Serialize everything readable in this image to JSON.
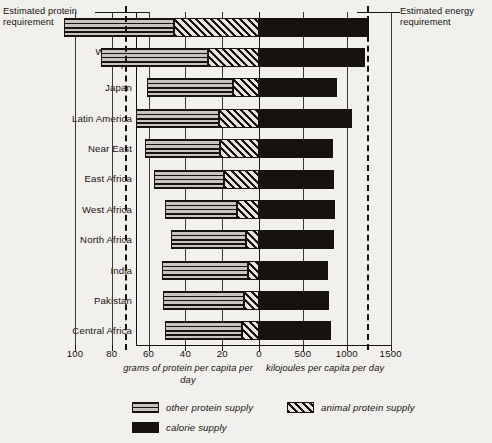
{
  "annotations": {
    "protein_requirement": "Estimated protein\nrequirement",
    "energy_requirement": "Estimated energy\nrequirement"
  },
  "axes": {
    "protein": {
      "title": "grams of protein per capita\nper day",
      "ticks": [
        100,
        80,
        60,
        40,
        20,
        0
      ],
      "tick_labels": [
        "100",
        "80",
        "60",
        "40",
        "20",
        "0"
      ]
    },
    "energy": {
      "title": "kilojoules per capita per day",
      "ticks": [
        0,
        500,
        1000,
        1500
      ],
      "tick_labels": [
        "0",
        "500",
        "1000",
        "1500"
      ]
    }
  },
  "legend": {
    "items": [
      {
        "key": "other",
        "label": "other protein supply",
        "pattern": "horizontal-lines"
      },
      {
        "key": "animal",
        "label": "animal protein supply",
        "pattern": "diagonal-hatch"
      },
      {
        "key": "calorie",
        "label": "calorie supply",
        "pattern": "solid-black"
      }
    ]
  },
  "chart_data": {
    "type": "bar",
    "subtype": "diverging-stacked-horizontal",
    "title": "",
    "xlabel_left": "grams of protein per capita per day",
    "xlabel_right": "kilojoules per capita per day",
    "ylabel": "",
    "grid": true,
    "legend_position": "bottom",
    "axis_left": {
      "range": [
        100,
        0
      ],
      "direction": "reversed",
      "ticks": [
        100,
        80,
        60,
        40,
        20,
        0
      ]
    },
    "axis_right": {
      "range": [
        0,
        1500
      ],
      "direction": "normal",
      "ticks": [
        0,
        500,
        1000,
        1500
      ]
    },
    "reference_lines": [
      {
        "name": "estimated protein requirement",
        "axis": "left",
        "value": 73,
        "style": "dashed"
      },
      {
        "name": "estimated energy requirement",
        "axis": "right",
        "value": 1230,
        "style": "dashed"
      }
    ],
    "categories": [
      "North\nAmerica",
      "Western\nEurope",
      "Japan",
      "Latin America",
      "Near East",
      "East Africa",
      "West Africa",
      "North Africa",
      "India",
      "Pakistan",
      "Central Africa"
    ],
    "category_names": [
      "North America",
      "Western Europe",
      "Japan",
      "Latin America",
      "Near East",
      "East Africa",
      "West Africa",
      "North Africa",
      "India",
      "Pakistan",
      "Central Africa"
    ],
    "series": [
      {
        "name": "other protein supply",
        "units": "grams of protein per capita per day",
        "values": [
          60,
          58,
          47,
          45,
          41,
          38,
          39,
          41,
          47,
          44,
          42
        ]
      },
      {
        "name": "animal protein supply",
        "units": "grams of protein per capita per day",
        "values": [
          46,
          28,
          14,
          22,
          21,
          19,
          12,
          7,
          6,
          8,
          9
        ]
      },
      {
        "name": "calorie supply",
        "units": "kilojoules per capita per day",
        "values": [
          1250,
          1210,
          890,
          1060,
          840,
          850,
          860,
          850,
          790,
          800,
          820
        ]
      }
    ]
  }
}
